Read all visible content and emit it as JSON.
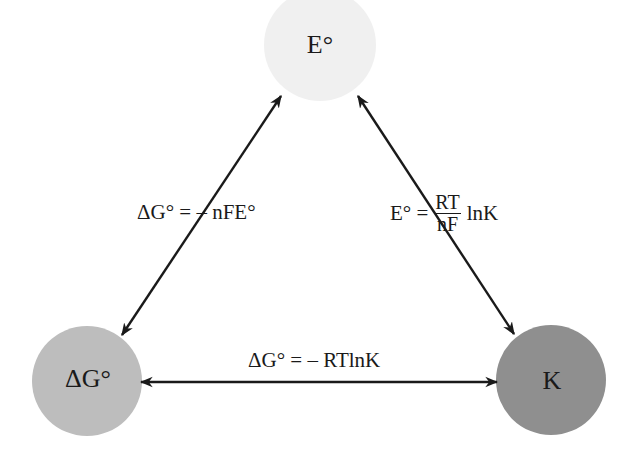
{
  "nodes": {
    "top": {
      "label": "E°",
      "color": "#f0f0f0",
      "cx": 320,
      "cy": 45,
      "r": 56
    },
    "left": {
      "label": "ΔG°",
      "color": "#bdbdbd",
      "cx": 87,
      "cy": 381,
      "r": 55
    },
    "right": {
      "label": "K",
      "color": "#8f8f8f",
      "cx": 551,
      "cy": 380,
      "r": 55
    }
  },
  "edges": {
    "left_top": {
      "equation": "ΔG° = – nFE°"
    },
    "right_top": {
      "prefix": "E° =",
      "numerator": "RT",
      "denominator": "nF",
      "suffix": "lnK"
    },
    "left_right": {
      "equation": "ΔG° = – RTlnK"
    }
  },
  "colors": {
    "arrow": "#1a1a1a"
  }
}
